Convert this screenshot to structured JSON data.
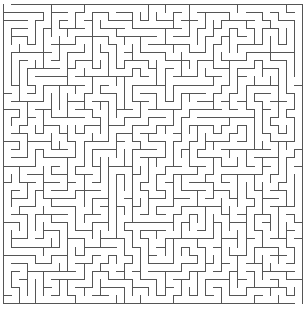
{
  "maze": {
    "cols": 37,
    "rows": 37,
    "cell_size": 8.1,
    "origin_x": 3,
    "origin_y": 4,
    "wall_color": "#555555",
    "background_color": "#ffffff",
    "wall_width": 1,
    "seed": 20240611,
    "entrance": {
      "side": "top",
      "col": 0
    },
    "exit": {
      "side": "bottom",
      "col": 36
    }
  }
}
